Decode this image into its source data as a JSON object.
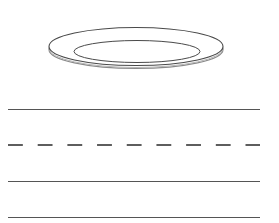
{
  "worksheet": {
    "type": "handwriting-practice",
    "picture": {
      "name": "plate-illustration",
      "subject": "plate"
    },
    "rules": [
      {
        "style": "solid",
        "role": "top-line",
        "y": 109
      },
      {
        "style": "dashed",
        "role": "midline",
        "y": 145
      },
      {
        "style": "solid",
        "role": "base-line",
        "y": 181
      },
      {
        "style": "solid",
        "role": "descender-line",
        "y": 217
      }
    ],
    "colors": {
      "background": "#ffffff",
      "line": "#555555",
      "dash": "#5e5e5e"
    }
  }
}
